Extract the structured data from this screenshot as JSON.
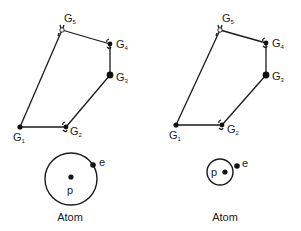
{
  "panels": [
    {
      "id": "left",
      "nodes": [
        {
          "name": "G",
          "sub": "1",
          "x": 20,
          "y": 127,
          "lx": 13,
          "ly": 141,
          "joint": "dot"
        },
        {
          "name": "G",
          "sub": "2",
          "x": 66,
          "y": 127,
          "lx": 70,
          "ly": 135,
          "joint": "hinge"
        },
        {
          "name": "G",
          "sub": "3",
          "x": 110,
          "y": 75,
          "lx": 116,
          "ly": 81,
          "joint": "dot-large"
        },
        {
          "name": "G",
          "sub": "4",
          "x": 110,
          "y": 44,
          "lx": 116,
          "ly": 48,
          "joint": "hinge"
        },
        {
          "name": "G",
          "sub": "5",
          "x": 62,
          "y": 30,
          "lx": 64,
          "ly": 22,
          "joint": "open-hinge"
        }
      ],
      "atom": {
        "cx": 71,
        "cy": 179,
        "r": 26,
        "p_label": "p",
        "p_dot": [
          71,
          177
        ],
        "p_label_pos": [
          67,
          194
        ],
        "e_label": "e",
        "e_dot": [
          93,
          165
        ],
        "e_label_pos": [
          99,
          166
        ],
        "caption": "Atom",
        "caption_pos": [
          70,
          221
        ]
      }
    },
    {
      "id": "right",
      "nodes": [
        {
          "name": "G",
          "sub": "1",
          "x": 176,
          "y": 125,
          "lx": 169,
          "ly": 139,
          "joint": "dot"
        },
        {
          "name": "G",
          "sub": "2",
          "x": 222,
          "y": 125,
          "lx": 227,
          "ly": 133,
          "joint": "hinge"
        },
        {
          "name": "G",
          "sub": "3",
          "x": 266,
          "y": 75,
          "lx": 272,
          "ly": 80,
          "joint": "dot-large"
        },
        {
          "name": "G",
          "sub": "4",
          "x": 266,
          "y": 43,
          "lx": 272,
          "ly": 47,
          "joint": "hinge"
        },
        {
          "name": "G",
          "sub": "5",
          "x": 220,
          "y": 30,
          "lx": 222,
          "ly": 22,
          "joint": "open-hinge"
        }
      ],
      "atom": {
        "cx": 220,
        "cy": 172,
        "r": 13,
        "p_label": "p",
        "p_dot": [
          225,
          172
        ],
        "p_label_pos": [
          211,
          176
        ],
        "e_label": "e",
        "e_dot": [
          237,
          166
        ],
        "e_label_pos": [
          242,
          167
        ],
        "caption": "Atom",
        "caption_pos": [
          225,
          221
        ]
      }
    }
  ]
}
